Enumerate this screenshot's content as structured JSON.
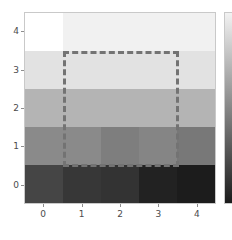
{
  "chart_data": {
    "type": "heatmap",
    "title": "",
    "xlabel": "",
    "ylabel": "",
    "x_tick_labels": [
      "0",
      "1",
      "2",
      "3",
      "4"
    ],
    "y_tick_labels": [
      "0",
      "1",
      "2",
      "3",
      "4"
    ],
    "x_tick_values": [
      0,
      1,
      2,
      3,
      4
    ],
    "y_tick_values": [
      0,
      1,
      2,
      3,
      4
    ],
    "xlim": [
      -0.5,
      4.5
    ],
    "ylim": [
      4.5,
      -0.5
    ],
    "grid": false,
    "legend": "none",
    "colormap": "gray",
    "colorbar": {
      "present": true,
      "position": "right",
      "clipped": true,
      "top_color": "#f2f2f2",
      "bottom_color": "#1b1b1b"
    },
    "rows": [
      0,
      1,
      2,
      3,
      4
    ],
    "columns": [
      0,
      1,
      2,
      3,
      4
    ],
    "values": [
      [
        1.0,
        0.95,
        0.95,
        0.95,
        0.95
      ],
      [
        0.88,
        0.88,
        0.88,
        0.88,
        0.88
      ],
      [
        0.7,
        0.7,
        0.7,
        0.7,
        0.7
      ],
      [
        0.52,
        0.52,
        0.46,
        0.5,
        0.44
      ],
      [
        0.26,
        0.2,
        0.18,
        0.11,
        0.09
      ]
    ],
    "cell_colors": [
      [
        "#ffffff",
        "#f1f1f1",
        "#f1f1f1",
        "#f1f1f1",
        "#f1f1f1"
      ],
      [
        "#e2e2e2",
        "#e2e2e2",
        "#e2e2e2",
        "#e2e2e2",
        "#e2e2e2"
      ],
      [
        "#b4b4b4",
        "#b4b4b4",
        "#b4b4b4",
        "#b4b4b4",
        "#b4b4b4"
      ],
      [
        "#8a8a8a",
        "#8a8a8a",
        "#7e7e7e",
        "#858585",
        "#787878"
      ],
      [
        "#454545",
        "#373737",
        "#333333",
        "#222222",
        "#1c1c1c"
      ]
    ],
    "annotation": {
      "type": "dashed-rectangle",
      "x_start": 0.5,
      "x_end": 3.5,
      "y_start": 0.5,
      "y_end": 3.5,
      "color": "#737373",
      "line_width_px": 3,
      "line_style": "dashed"
    }
  },
  "axes": {
    "spine_color": "#c9c9c9",
    "tick_color": "#8d8d8d",
    "label_color": "#4b4b4b"
  }
}
